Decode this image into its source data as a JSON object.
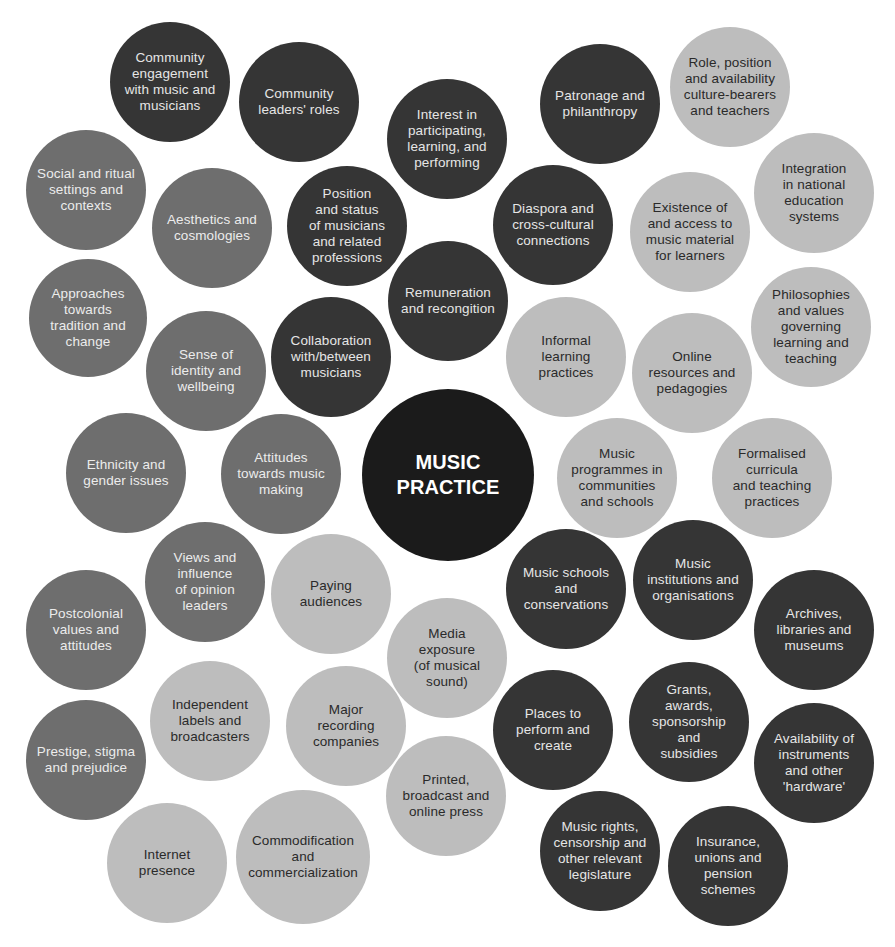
{
  "title": "MUSIC PRACTICE",
  "colors": {
    "center": "#1b1b1b",
    "dark": "#353535",
    "mid": "#6e6e6e",
    "light": "#bdbdbd"
  },
  "center": {
    "label": "MUSIC\nPRACTICE",
    "x": 448,
    "y": 475,
    "r": 86
  },
  "bubbles": [
    {
      "label": "Community\nengagement\nwith music and\nmusicians",
      "tone": "dark",
      "x": 170,
      "y": 82,
      "r": 60
    },
    {
      "label": "Community\nleaders' roles",
      "tone": "dark",
      "x": 299,
      "y": 102,
      "r": 60
    },
    {
      "label": "Interest in\nparticipating,\nlearning, and\nperforming",
      "tone": "dark",
      "x": 447,
      "y": 139,
      "r": 60
    },
    {
      "label": "Patronage and\nphilanthropy",
      "tone": "dark",
      "x": 600,
      "y": 104,
      "r": 60
    },
    {
      "label": "Role, position\nand availability\nculture-bearers\nand teachers",
      "tone": "light",
      "x": 730,
      "y": 87,
      "r": 60
    },
    {
      "label": "Social and ritual\nsettings and\ncontexts",
      "tone": "mid",
      "x": 86,
      "y": 190,
      "r": 60
    },
    {
      "label": "Aesthetics and\ncosmologies",
      "tone": "mid",
      "x": 212,
      "y": 228,
      "r": 60
    },
    {
      "label": "Position\nand status\nof musicians\nand related\nprofessions",
      "tone": "dark",
      "x": 347,
      "y": 226,
      "r": 60
    },
    {
      "label": "Diaspora and\ncross-cultural\nconnections",
      "tone": "dark",
      "x": 553,
      "y": 225,
      "r": 60
    },
    {
      "label": "Existence of\nand access to\nmusic material\nfor learners",
      "tone": "light",
      "x": 690,
      "y": 232,
      "r": 60
    },
    {
      "label": "Integration\nin national\neducation\nsystems",
      "tone": "light",
      "x": 814,
      "y": 193,
      "r": 60
    },
    {
      "label": "Approaches\ntowards\ntradition and\nchange",
      "tone": "mid",
      "x": 88,
      "y": 318,
      "r": 59
    },
    {
      "label": "Remuneration\nand recongition",
      "tone": "dark",
      "x": 448,
      "y": 301,
      "r": 60
    },
    {
      "label": "Sense of\nidentity and\nwellbeing",
      "tone": "mid",
      "x": 206,
      "y": 371,
      "r": 60
    },
    {
      "label": "Collaboration\nwith/between\nmusicians",
      "tone": "dark",
      "x": 331,
      "y": 357,
      "r": 60
    },
    {
      "label": "Informal\nlearning\npractices",
      "tone": "light",
      "x": 566,
      "y": 357,
      "r": 60
    },
    {
      "label": "Online\nresources and\npedagogies",
      "tone": "light",
      "x": 692,
      "y": 373,
      "r": 60
    },
    {
      "label": "Philosophies\nand values\ngoverning\nlearning and\nteaching",
      "tone": "light",
      "x": 811,
      "y": 327,
      "r": 60
    },
    {
      "label": "Ethnicity and\ngender issues",
      "tone": "mid",
      "x": 126,
      "y": 473,
      "r": 60
    },
    {
      "label": "Attitudes\ntowards music\nmaking",
      "tone": "mid",
      "x": 281,
      "y": 474,
      "r": 60
    },
    {
      "label": "Music\nprogrammes in\ncommunities\nand schools",
      "tone": "light",
      "x": 617,
      "y": 478,
      "r": 60
    },
    {
      "label": "Formalised\ncurricula\nand teaching\npractices",
      "tone": "light",
      "x": 772,
      "y": 478,
      "r": 60
    },
    {
      "label": "Views and\ninfluence\nof opinion\nleaders",
      "tone": "mid",
      "x": 205,
      "y": 582,
      "r": 60
    },
    {
      "label": "Paying\naudiences",
      "tone": "light",
      "x": 331,
      "y": 594,
      "r": 60
    },
    {
      "label": "Music schools\nand\nconservations",
      "tone": "dark",
      "x": 566,
      "y": 589,
      "r": 60
    },
    {
      "label": "Music\ninstitutions and\norganisations",
      "tone": "dark",
      "x": 693,
      "y": 580,
      "r": 60
    },
    {
      "label": "Archives,\nlibraries and\nmuseums",
      "tone": "dark",
      "x": 814,
      "y": 630,
      "r": 60
    },
    {
      "label": "Postcolonial\nvalues and\nattitudes",
      "tone": "mid",
      "x": 86,
      "y": 630,
      "r": 60
    },
    {
      "label": "Media\nexposure\n(of musical\nsound)",
      "tone": "light",
      "x": 447,
      "y": 658,
      "r": 60
    },
    {
      "label": "Independent\nlabels and\nbroadcasters",
      "tone": "light",
      "x": 210,
      "y": 721,
      "r": 60
    },
    {
      "label": "Major\nrecording\ncompanies",
      "tone": "light",
      "x": 346,
      "y": 726,
      "r": 60
    },
    {
      "label": "Places to\nperform and\ncreate",
      "tone": "dark",
      "x": 553,
      "y": 730,
      "r": 60
    },
    {
      "label": "Grants,\nawards,\nsponsorship\nand\nsubsidies",
      "tone": "dark",
      "x": 689,
      "y": 722,
      "r": 60
    },
    {
      "label": "Availability of\ninstruments\nand other\n'hardware'",
      "tone": "dark",
      "x": 814,
      "y": 763,
      "r": 60
    },
    {
      "label": "Prestige, stigma\nand prejudice",
      "tone": "mid",
      "x": 86,
      "y": 760,
      "r": 60
    },
    {
      "label": "Printed,\nbroadcast and\nonline press",
      "tone": "light",
      "x": 446,
      "y": 796,
      "r": 60
    },
    {
      "label": "Internet\npresence",
      "tone": "light",
      "x": 167,
      "y": 863,
      "r": 60
    },
    {
      "label": "Commodification\nand\ncommercialization",
      "tone": "light",
      "x": 303,
      "y": 857,
      "r": 67
    },
    {
      "label": "Music rights,\ncensorship and\nother relevant\nlegislature",
      "tone": "dark",
      "x": 600,
      "y": 851,
      "r": 60
    },
    {
      "label": "Insurance,\nunions and\npension\nschemes",
      "tone": "dark",
      "x": 728,
      "y": 866,
      "r": 60
    }
  ]
}
